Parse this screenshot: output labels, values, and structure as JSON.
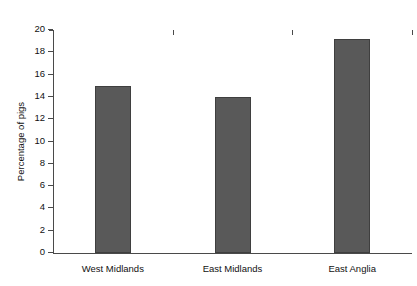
{
  "figure": {
    "clipped_caption": "",
    "background": "#ffffff"
  },
  "style": {
    "bar_fill": "#595959",
    "bar_edge": "#3f3f3f",
    "axis_color": "#4a4a4a",
    "text_color": "#111111"
  },
  "chart_data": {
    "type": "bar",
    "title": "",
    "xlabel": "",
    "ylabel": "Percentage of pigs",
    "categories": [
      "West Midlands",
      "East Midlands",
      "East Anglia"
    ],
    "values": [
      15,
      14,
      19.2
    ],
    "ylim": [
      0,
      20
    ],
    "ytick_values": [
      0,
      2,
      4,
      6,
      8,
      10,
      12,
      14,
      16,
      18,
      20
    ],
    "ytick_labels": [
      "0",
      "2",
      "4",
      "6",
      "8",
      "10",
      "12",
      "14",
      "16",
      "18",
      "20"
    ],
    "grid": false,
    "legend": null,
    "series": [
      {
        "name": "Percentage of pigs",
        "values": [
          15,
          14,
          19.2
        ]
      }
    ]
  }
}
